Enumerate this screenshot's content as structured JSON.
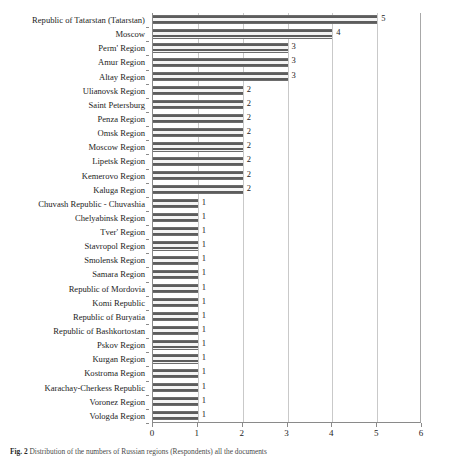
{
  "chart_data": {
    "type": "bar",
    "orientation": "horizontal",
    "title": "",
    "xlabel": "",
    "ylabel": "",
    "xlim": [
      0,
      6
    ],
    "xticks": [
      0,
      1,
      2,
      3,
      4,
      5,
      6
    ],
    "xtick_labels": [
      "0",
      "1",
      "2",
      "3",
      "4",
      "5",
      "6"
    ],
    "grid": "vertical",
    "legend": "none",
    "show_value_labels": true,
    "bar_fill": "horizontal-stripe-hatch",
    "categories": [
      "Republic of Tatarstan (Tatarstan)",
      "Moscow",
      "Perm' Region",
      "Amur Region",
      "Altay Region",
      "Ulianovsk Region",
      "Saint Petersburg",
      "Penza Region",
      "Omsk Region",
      "Moscow Region",
      "Lipetsk Region",
      "Kemerovo Region",
      "Kaluga Region",
      "Chuvash Republic - Chuvashia",
      "Chelyabinsk Region",
      "Tver' Region",
      "Stavropol Region",
      "Smolensk Region",
      "Samara Region",
      "Republic of Mordovia",
      "Komi Republic",
      "Republic of Buryatia",
      "Republic of Bashkortostan",
      "Pskov Region",
      "Kurgan Region",
      "Kostroma Region",
      "Karachay-Cherkess Republic",
      "Voronez Region",
      "Vologda Region"
    ],
    "values": [
      5,
      4,
      3,
      3,
      3,
      2,
      2,
      2,
      2,
      2,
      2,
      2,
      2,
      1,
      1,
      1,
      1,
      1,
      1,
      1,
      1,
      1,
      1,
      1,
      1,
      1,
      1,
      1,
      1
    ],
    "value_labels": [
      "5",
      "4",
      "3",
      "3",
      "3",
      "2",
      "2",
      "2",
      "2",
      "2",
      "2",
      "2",
      "2",
      "1",
      "1",
      "1",
      "1",
      "1",
      "1",
      "1",
      "1",
      "1",
      "1",
      "1",
      "1",
      "1",
      "1",
      "1",
      "1"
    ]
  },
  "caption": {
    "figure_label": "Fig. 2",
    "text": "Distribution of the numbers of Russian regions (Respondents) all the documents"
  },
  "colors": {
    "bar_stripe": "#5d5d5d",
    "bar_background": "#f2f2f2",
    "axis": "#8a8a8a",
    "gridline": "#c9c9c9",
    "text": "#1c1c1c"
  }
}
